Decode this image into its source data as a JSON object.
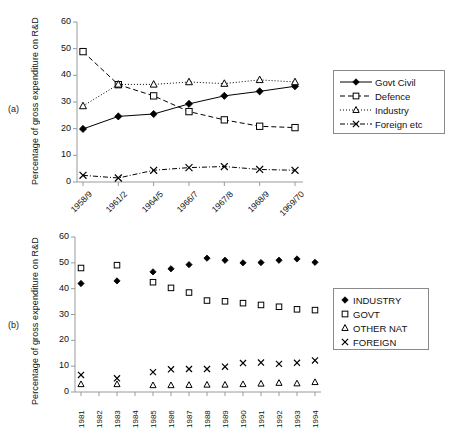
{
  "figure": {
    "panel_a_tag": "(a)",
    "panel_b_tag": "(b)",
    "ylabel": "Percentage of gross expenditure on R&D"
  },
  "chart_data": [
    {
      "id": "panel-a",
      "type": "line",
      "title": "",
      "panel": "(a)",
      "xlabel": "",
      "ylabel": "Percentage of gross expenditure on R&D",
      "ylim": [
        0,
        60
      ],
      "yticks": [
        0,
        10,
        20,
        30,
        40,
        50,
        60
      ],
      "grid": false,
      "legend_position": "right",
      "categories": [
        "1958/9",
        "1961/2",
        "1964/5",
        "1966/7",
        "1967/8",
        "1968/9",
        "1969/70"
      ],
      "series": [
        {
          "name": "Govt Civil",
          "marker": "filled-diamond",
          "line": "solid",
          "values": [
            19.9,
            24.6,
            25.5,
            29.3,
            32.3,
            34.0,
            35.9
          ]
        },
        {
          "name": "Defence",
          "marker": "open-square",
          "line": "dashed",
          "values": [
            48.9,
            36.5,
            32.3,
            26.4,
            23.3,
            20.9,
            20.4
          ]
        },
        {
          "name": "Industry",
          "marker": "open-triangle",
          "line": "dotted",
          "values": [
            28.5,
            36.6,
            36.6,
            37.5,
            36.9,
            38.3,
            37.5
          ]
        },
        {
          "name": "Foreign etc",
          "marker": "cross",
          "line": "dash-dot",
          "values": [
            2.5,
            1.5,
            4.4,
            5.4,
            5.8,
            4.7,
            4.4
          ]
        }
      ]
    },
    {
      "id": "panel-b",
      "type": "scatter",
      "title": "",
      "panel": "(b)",
      "xlabel": "",
      "ylabel": "Percentage of gross expenditure on R&D",
      "ylim": [
        0,
        60
      ],
      "yticks": [
        0,
        10,
        20,
        30,
        40,
        50,
        60
      ],
      "grid": false,
      "legend_position": "right",
      "categories": [
        "1981",
        "1982",
        "1983",
        "1984",
        "1985",
        "1986",
        "1987",
        "1988",
        "1989",
        "1990",
        "1991",
        "1992",
        "1993",
        "1994"
      ],
      "series": [
        {
          "name": "INDUSTRY",
          "marker": "filled-diamond",
          "values": [
            42.0,
            null,
            43.0,
            null,
            46.5,
            47.7,
            49.3,
            51.8,
            51.0,
            50.0,
            50.1,
            51.0,
            51.5,
            50.2
          ]
        },
        {
          "name": "GOVT",
          "marker": "open-square",
          "values": [
            48.0,
            null,
            49.1,
            null,
            42.5,
            40.3,
            38.5,
            35.4,
            35.1,
            34.4,
            33.7,
            33.0,
            32.0,
            31.7
          ]
        },
        {
          "name": "OTHER NAT",
          "marker": "open-triangle",
          "values": [
            3.0,
            null,
            3.0,
            null,
            2.6,
            2.6,
            2.7,
            2.8,
            2.8,
            3.0,
            3.2,
            3.5,
            3.3,
            3.8
          ]
        },
        {
          "name": "FOREIGN",
          "marker": "cross",
          "values": [
            6.6,
            null,
            5.3,
            null,
            7.7,
            8.8,
            8.9,
            8.9,
            9.8,
            11.2,
            11.4,
            10.9,
            11.3,
            12.2
          ]
        }
      ]
    }
  ],
  "legend_a": {
    "items": [
      {
        "label": "Govt Civil",
        "marker": "filled-diamond",
        "line": "solid"
      },
      {
        "label": "Defence",
        "marker": "open-square",
        "line": "dashed"
      },
      {
        "label": "Industry",
        "marker": "open-triangle",
        "line": "dotted"
      },
      {
        "label": "Foreign etc",
        "marker": "cross",
        "line": "dash-dot"
      }
    ]
  },
  "legend_b": {
    "items": [
      {
        "label": "INDUSTRY",
        "marker": "filled-diamond"
      },
      {
        "label": "GOVT",
        "marker": "open-square"
      },
      {
        "label": "OTHER NAT",
        "marker": "open-triangle"
      },
      {
        "label": "FOREIGN",
        "marker": "cross"
      }
    ]
  },
  "colors": {
    "ink": "#000000",
    "axis": "#9a9a9a",
    "background": "#ffffff"
  }
}
